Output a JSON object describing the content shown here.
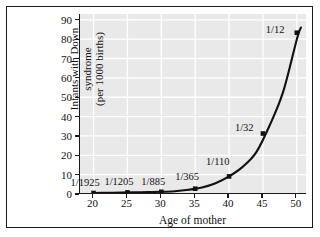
{
  "chart_data": {
    "type": "line",
    "title": "",
    "xlabel": "Age of mother",
    "ylabel_line1": "Infants with Down syndrome",
    "ylabel_line2": "(per 1000 births)",
    "xlim": [
      18,
      51.5
    ],
    "ylim": [
      0,
      93
    ],
    "xticks": [
      "20",
      "25",
      "30",
      "35",
      "40",
      "45",
      "50"
    ],
    "xtick_values": [
      20,
      25,
      30,
      35,
      40,
      45,
      50
    ],
    "yticks": [
      "0",
      "10",
      "20",
      "30",
      "40",
      "50",
      "60",
      "70",
      "80",
      "90"
    ],
    "ytick_values": [
      0,
      10,
      20,
      30,
      40,
      50,
      60,
      70,
      80,
      90
    ],
    "grid": true,
    "grid_color": "#ffffff",
    "plot_background": "#e9e9e9",
    "line_color": "#111111",
    "marker_color": "#111111",
    "legend": "none",
    "x": [
      20,
      25,
      30,
      35,
      40,
      45,
      50
    ],
    "values": [
      0.52,
      0.83,
      1.13,
      2.74,
      9.09,
      31.25,
      83.33
    ],
    "point_labels": [
      "1/1925",
      "1/1205",
      "1/885",
      "1/365",
      "1/110",
      "1/32",
      "1/12"
    ],
    "curve_x": [
      20,
      22,
      24,
      26,
      28,
      30,
      32,
      34,
      36,
      38,
      40,
      42,
      44,
      46,
      48,
      50,
      50.6
    ],
    "curve_y": [
      0.52,
      0.64,
      0.74,
      0.88,
      1.0,
      1.13,
      1.45,
      2.2,
      3.4,
      5.6,
      9.09,
      14.0,
      21.5,
      35.5,
      53.0,
      80.0,
      86.0
    ]
  }
}
